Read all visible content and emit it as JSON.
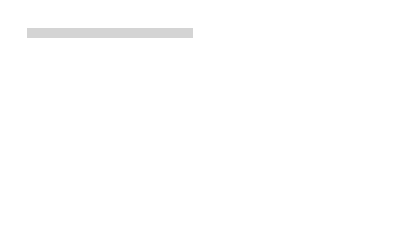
{
  "figure": {
    "panel_label": "(a)",
    "colors": {
      "bar_fill": "#d4d4d4",
      "bar_stroke": "#333333",
      "dash": "#333333",
      "text": "#333333"
    },
    "operon": {
      "labels": {
        "p": "P",
        "trpL": "trpL",
        "trpE": "trpE",
        "trpD": "trpD",
        "trpC": "trpC",
        "trpB": "trpB",
        "trpA": "trpA"
      }
    },
    "expanded": {
      "labels": {
        "promoter": "promoter",
        "operator": "operator",
        "trpL": "trpL",
        "attenuator": "attenuator",
        "trpE": "trpE"
      },
      "annotations": {
        "start_line1": "transcription",
        "start_line2": "start site",
        "pause_line1": "transcription",
        "pause_line2": "pause site",
        "term_line1": "transcription",
        "term_line2": "termination site"
      }
    },
    "cut_off_text": "leader peptide"
  }
}
